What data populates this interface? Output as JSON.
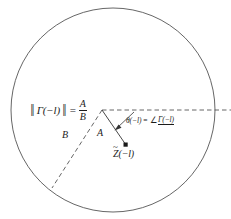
{
  "figure": {
    "name": "smith-chart-reflection-coefficient-diagram",
    "background_color": "#ffffff",
    "stroke_color": "#444444",
    "text_color": "#1c1c1c",
    "circle": {
      "label": "unit-circle",
      "center_x": 113,
      "center_y": 110,
      "radius": 102
    },
    "horizontal_axis": {
      "label": "real-axis-dashed",
      "style": "dashed",
      "x_start": 102,
      "x_end": 231,
      "y": 110
    },
    "vertex": {
      "x": 102,
      "y": 110
    },
    "point_marker": {
      "label": "Z-tilde-point",
      "x": 126,
      "y": 145
    },
    "segment_A": {
      "from_x": 102,
      "from_y": 110,
      "to_x": 126,
      "to_y": 145
    },
    "segment_B": {
      "from_x": 102,
      "from_y": 110,
      "to_x": 52,
      "to_y": 188,
      "style": "dashed"
    },
    "angle_arrow": {
      "from_x": 133,
      "from_y": 113,
      "to_x": 116,
      "to_y": 129
    }
  },
  "labels": {
    "magnitude": {
      "bar_left": "‖",
      "bar_right": "‖",
      "gamma_expression": "Γ(−l)",
      "equals": "=",
      "numerator": "A",
      "denominator": "B"
    },
    "angle": {
      "theta_expression": "θ(−l)",
      "equals": "=",
      "angle_symbol": "∠",
      "gamma_expression": "Γ(−l)"
    },
    "segment_a_label": "A",
    "segment_b_label": "B",
    "point": {
      "tilde": "~",
      "base": "Z",
      "argument": "(−l)"
    }
  }
}
